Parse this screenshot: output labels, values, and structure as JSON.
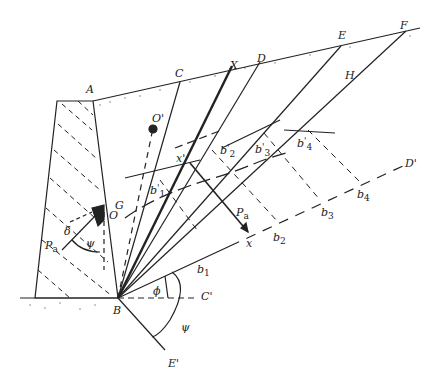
{
  "diagram": {
    "points": {
      "A": "A",
      "B": "B",
      "C": "C",
      "D": "D",
      "E": "E",
      "F": "F",
      "H": "H",
      "X": "X",
      "G": "G",
      "O": "O",
      "O_prime": "O'",
      "C_prime": "C'",
      "D_prime": "D'",
      "E_prime": "E'",
      "x": "x",
      "x_prime": "x'"
    },
    "b_points": [
      {
        "base": "b",
        "sub": "1"
      },
      {
        "base": "b",
        "sub": "2"
      },
      {
        "base": "b",
        "sub": "3"
      },
      {
        "base": "b",
        "sub": "4"
      }
    ],
    "b_prime_points": [
      {
        "base": "b",
        "sub": "1",
        "sup": "'"
      },
      {
        "base": "b",
        "sub": "2",
        "sup": "'"
      },
      {
        "base": "b",
        "sub": "3",
        "sup": "'"
      },
      {
        "base": "b",
        "sub": "4",
        "sup": "'"
      }
    ],
    "forces": {
      "Pa_wall": {
        "base": "P",
        "sub": "a"
      },
      "Pa_diag": {
        "base": "P",
        "sub": "a"
      }
    },
    "angles": {
      "delta": "δ",
      "psi_wall": "ψ",
      "phi": "ϕ",
      "psi_base": "ψ"
    },
    "colors": {
      "ink": "#222222",
      "background": "#ffffff"
    }
  }
}
